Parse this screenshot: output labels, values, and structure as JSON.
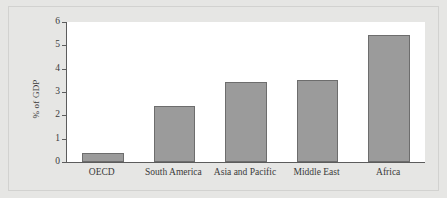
{
  "chart_data": {
    "type": "bar",
    "title": "",
    "xlabel": "",
    "ylabel": "% of GDP",
    "categories": [
      "OECD",
      "South America",
      "Asia and Pacific",
      "Middle East",
      "Africa"
    ],
    "values": [
      0.4,
      2.4,
      3.45,
      3.5,
      5.45
    ],
    "ylim": [
      0,
      6
    ],
    "ytick_labels": [
      "0",
      "1",
      "2",
      "3",
      "4",
      "5",
      "6"
    ],
    "ytick_values": [
      0,
      1,
      2,
      3,
      4,
      5,
      6
    ],
    "grid": false,
    "legend": null,
    "series": [
      {
        "name": "% of GDP",
        "values": [
          0.4,
          2.4,
          3.45,
          3.5,
          5.45
        ]
      }
    ]
  },
  "style": {
    "bar_fill": "#9b9b9b",
    "bar_edge": "#6d6d6d",
    "axis_color": "#5c5c5c",
    "text_color": "#3a3a3a",
    "plot_background": "#ffffff",
    "figure_background": "#e6e6e4"
  }
}
